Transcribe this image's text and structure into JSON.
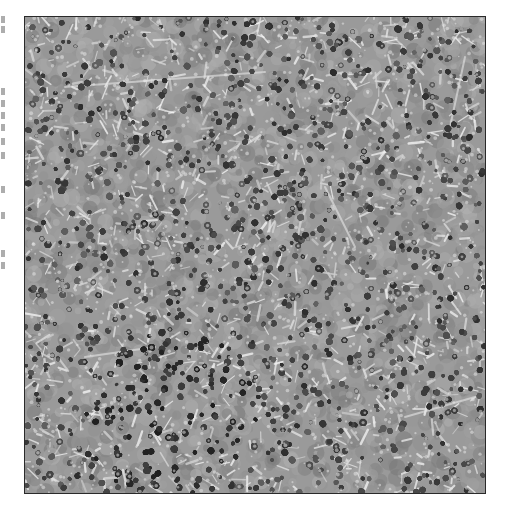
{
  "page": {
    "width": 505,
    "height": 522,
    "background": "#ffffff"
  },
  "figure": {
    "type": "histology-micrograph",
    "frame": {
      "x": 24,
      "y": 16,
      "width": 460,
      "height": 476,
      "border_color": "#2a2a2a"
    },
    "palette": {
      "background_gray": "#9a9a9a",
      "nucleus_dark": "#3a3a3a",
      "cytoplasm_mid": "#8c8c8c",
      "interstitial_light": "#d8d8d8"
    },
    "dense_region": {
      "cx": 150,
      "cy": 400,
      "radius": 90
    }
  },
  "margin_fragments": {
    "description": "Clipped text from adjacent column (illegible)",
    "marks_y": [
      16,
      26,
      88,
      100,
      112,
      124,
      138,
      152,
      186,
      212,
      250,
      262
    ]
  }
}
